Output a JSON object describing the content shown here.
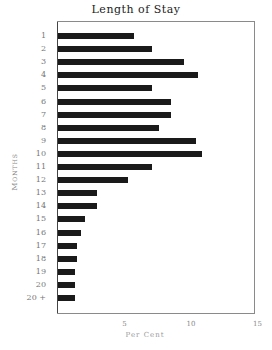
{
  "chart_data": {
    "type": "bar",
    "orientation": "horizontal",
    "title": "Length of Stay",
    "xlabel": "Per Cent",
    "ylabel": "Months",
    "categories": [
      "1",
      "2",
      "3",
      "4",
      "5",
      "6",
      "7",
      "8",
      "9",
      "10",
      "11",
      "12",
      "13",
      "14",
      "15",
      "16",
      "17",
      "18",
      "19",
      "20",
      "20 +"
    ],
    "values": [
      5.7,
      7.1,
      9.5,
      10.5,
      7.1,
      8.5,
      8.5,
      7.6,
      10.4,
      10.8,
      7.1,
      5.3,
      2.9,
      2.9,
      2.0,
      1.7,
      1.4,
      1.4,
      1.3,
      1.3,
      1.3
    ],
    "xticks": [
      "5",
      "10",
      "15"
    ],
    "xlim": [
      0,
      15
    ],
    "grid": false,
    "legend": null,
    "bar_color": "#1a1a1a"
  }
}
